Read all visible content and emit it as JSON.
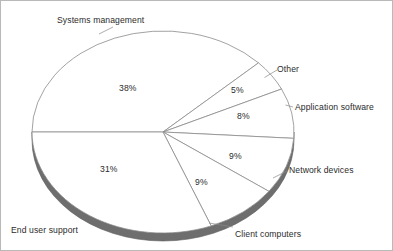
{
  "chart_data": {
    "type": "pie",
    "title": "",
    "subtitle": "",
    "xlabel": "",
    "ylabel": "",
    "legend_position": "none",
    "grid": false,
    "labels_outside": true,
    "value_unit": "%",
    "categories": [
      "Systems management",
      "Other",
      "Application software",
      "Network devices",
      "Client computers",
      "End user support"
    ],
    "values": [
      38,
      5,
      8,
      9,
      9,
      31
    ],
    "value_labels": [
      "38%",
      "5%",
      "8%",
      "9%",
      "9%",
      "31%"
    ],
    "slices": [
      {
        "name": "Systems management",
        "value": 38,
        "value_label": "38%",
        "label": "Systems management",
        "fill": "#ffffff",
        "stroke": "#8a8a8a"
      },
      {
        "name": "Other",
        "value": 5,
        "value_label": "5%",
        "label": "Other",
        "fill": "#ffffff",
        "stroke": "#8a8a8a"
      },
      {
        "name": "Application software",
        "value": 8,
        "value_label": "8%",
        "label": "Application software",
        "fill": "#ffffff",
        "stroke": "#8a8a8a"
      },
      {
        "name": "Network devices",
        "value": 9,
        "value_label": "9%",
        "label": "Network devices",
        "fill": "#ffffff",
        "stroke": "#8a8a8a"
      },
      {
        "name": "Client computers",
        "value": 9,
        "value_label": "9%",
        "label": "Client computers",
        "fill": "#ffffff",
        "stroke": "#8a8a8a"
      },
      {
        "name": "End user support",
        "value": 31,
        "value_label": "31%",
        "label": "End user support",
        "fill": "#ffffff",
        "stroke": "#8a8a8a"
      }
    ],
    "colors": {
      "slice_fill": "#ffffff",
      "slice_outline": "#8a8a8a",
      "shadow_band": "#6e6e6e",
      "label_text": "#2b2b2b",
      "frame_border": "#b9b9b9",
      "leader_line": "#8a8a8a"
    },
    "geometry": {
      "center_x": 162,
      "center_y": 131,
      "radius_x": 131,
      "radius_y": 101,
      "depth": 8,
      "start_angle_deg": 180
    }
  }
}
